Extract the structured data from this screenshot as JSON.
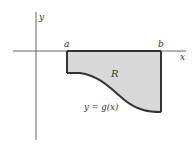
{
  "diagram": {
    "axis_labels": {
      "x": "x",
      "y": "y"
    },
    "bound_labels": {
      "a": "a",
      "b": "b"
    },
    "region_label": "R",
    "curve_label": "y = g(x)",
    "colors": {
      "axis": "#555555",
      "region_fill": "#d9d9d9",
      "region_stroke": "#333333",
      "text": "#333333"
    }
  }
}
